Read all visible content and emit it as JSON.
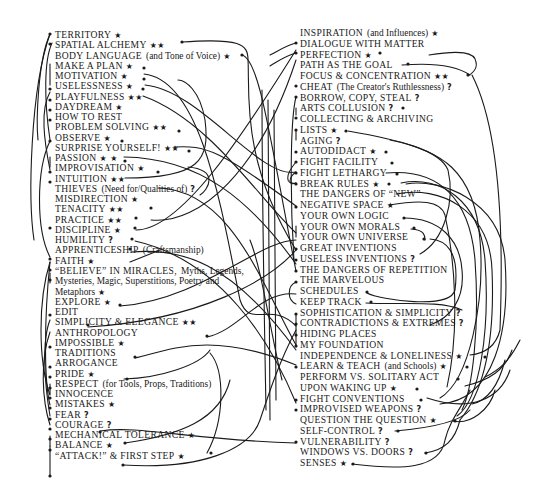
{
  "marks": {
    "star": "★",
    "two_stars": "★★",
    "question": "?"
  },
  "left": [
    {
      "text": "TERRITORY",
      "sub": "",
      "mark": "★"
    },
    {
      "text": "SPATIAL ALCHEMY",
      "sub": "",
      "mark": "★★"
    },
    {
      "text": "BODY LANGUAGE",
      "sub": "(and Tone of Voice)",
      "mark": "★"
    },
    {
      "text": "MAKE A PLAN",
      "sub": "",
      "mark": "★"
    },
    {
      "text": "MOTIVATION",
      "sub": "",
      "mark": "★"
    },
    {
      "text": "USELESSNESS",
      "sub": "",
      "mark": "★"
    },
    {
      "text": "PLAYFULNESS",
      "sub": "",
      "mark": "★★"
    },
    {
      "text": "DAYDREAM",
      "sub": "",
      "mark": "★"
    },
    {
      "text": "HOW TO REST",
      "sub": "",
      "mark": ""
    },
    {
      "text": "PROBLEM SOLVING",
      "sub": "",
      "mark": "★★"
    },
    {
      "text": "OBSERVE",
      "sub": "",
      "mark": "★"
    },
    {
      "text": "SURPRISE YOURSELF!",
      "sub": "",
      "mark": "★★"
    },
    {
      "text": "PASSION",
      "sub": "",
      "mark": "★ ★"
    },
    {
      "text": "IMPROVISATION",
      "sub": "",
      "mark": "★"
    },
    {
      "text": "INTUITION",
      "sub": "",
      "mark": "★★"
    },
    {
      "text": "THIEVES",
      "sub": "(Need for/Qualities of)",
      "mark": "?"
    },
    {
      "text": "MISDIRECTION",
      "sub": "",
      "mark": "★"
    },
    {
      "text": "TENACITY",
      "sub": "",
      "mark": "★★"
    },
    {
      "text": "PRACTICE",
      "sub": "",
      "mark": "★★"
    },
    {
      "text": "DISCIPLINE",
      "sub": "",
      "mark": "★"
    },
    {
      "text": "HUMILITY",
      "sub": "",
      "mark": "?"
    },
    {
      "text": "APPRENTICESHIP",
      "sub": "(Craftsmanship)",
      "mark": ""
    },
    {
      "text": "FAITH",
      "sub": "",
      "mark": "★"
    },
    {
      "text": "“BELIEVE” IN MIRACLES,",
      "sub": "Myths, Legends,",
      "mark": ""
    },
    {
      "text": "",
      "sub": "Mysteries, Magic, Superstitions, Poetry and",
      "mark": ""
    },
    {
      "text": "",
      "sub": "Metaphors",
      "mark": "★"
    },
    {
      "text": "EXPLORE",
      "sub": "",
      "mark": "★"
    },
    {
      "text": "EDIT",
      "sub": "",
      "mark": ""
    },
    {
      "text": "SIMPLICITY & ELEGANCE",
      "sub": "",
      "mark": "★★"
    },
    {
      "text": "ANTHROPOLOGY",
      "sub": "",
      "mark": ""
    },
    {
      "text": "IMPOSSIBLE",
      "sub": "",
      "mark": "★"
    },
    {
      "text": "TRADITIONS",
      "sub": "",
      "mark": ""
    },
    {
      "text": "ARROGANCE",
      "sub": "",
      "mark": ""
    },
    {
      "text": "PRIDE",
      "sub": "",
      "mark": "★"
    },
    {
      "text": "RESPECT",
      "sub": "(for Tools, Props, Traditions)",
      "mark": ""
    },
    {
      "text": "INNOCENCE",
      "sub": "",
      "mark": ""
    },
    {
      "text": "MISTAKES",
      "sub": "",
      "mark": "★"
    },
    {
      "text": "FEAR",
      "sub": "",
      "mark": "?"
    },
    {
      "text": "COURAGE",
      "sub": "",
      "mark": "?"
    },
    {
      "text": "MECHANICAL TOLERANCE",
      "sub": "",
      "mark": "★"
    },
    {
      "text": "BALANCE",
      "sub": "",
      "mark": "★"
    },
    {
      "text": "“ATTACK!” & FIRST STEP",
      "sub": "",
      "mark": "★"
    }
  ],
  "right": [
    {
      "text": "INSPIRATION",
      "sub": "(and Influences)",
      "mark": "★"
    },
    {
      "text": "DIALOGUE WITH MATTER",
      "sub": "",
      "mark": ""
    },
    {
      "text": "PERFECTION",
      "sub": "",
      "mark": "★"
    },
    {
      "text": "PATH AS THE GOAL",
      "sub": "",
      "mark": ""
    },
    {
      "text": "FOCUS & CONCENTRATION",
      "sub": "",
      "mark": "★★"
    },
    {
      "text": "CHEAT",
      "sub": "(The Creator's Ruthlessness)",
      "mark": "?"
    },
    {
      "text": "BORROW, COPY, STEAL",
      "sub": "",
      "mark": "?"
    },
    {
      "text": "ARTS COLLUSION",
      "sub": "",
      "mark": "?"
    },
    {
      "text": "COLLECTING & ARCHIVING",
      "sub": "",
      "mark": ""
    },
    {
      "text": "LISTS",
      "sub": "",
      "mark": "★"
    },
    {
      "text": "AGING",
      "sub": "",
      "mark": "?"
    },
    {
      "text": "AUTODIDACT",
      "sub": "",
      "mark": "★"
    },
    {
      "text": "FIGHT FACILITY",
      "sub": "",
      "mark": ""
    },
    {
      "text": "FIGHT LETHARGY",
      "sub": "",
      "mark": ""
    },
    {
      "text": "BREAK RULES",
      "sub": "",
      "mark": "★"
    },
    {
      "text": "THE DANGERS OF “NEW”",
      "sub": "",
      "mark": ""
    },
    {
      "text": "NEGATIVE SPACE",
      "sub": "",
      "mark": "★"
    },
    {
      "text": "YOUR OWN LOGIC",
      "sub": "",
      "mark": ""
    },
    {
      "text": "YOUR OWN MORALS",
      "sub": "",
      "mark": ""
    },
    {
      "text": "YOUR OWN UNIVERSE",
      "sub": "",
      "mark": ""
    },
    {
      "text": "GREAT INVENTIONS",
      "sub": "",
      "mark": ""
    },
    {
      "text": "USELESS INVENTIONS",
      "sub": "",
      "mark": "?"
    },
    {
      "text": "THE DANGERS OF REPETITION",
      "sub": "",
      "mark": ""
    },
    {
      "text": "THE MARVELOUS",
      "sub": "",
      "mark": ""
    },
    {
      "text": "SCHEDULES",
      "sub": "",
      "mark": ""
    },
    {
      "text": "KEEP TRACK",
      "sub": "",
      "mark": ""
    },
    {
      "text": "SOPHISTICATION & SIMPLICITY",
      "sub": "",
      "mark": "?"
    },
    {
      "text": "CONTRADICTIONS & EXTREMES",
      "sub": "",
      "mark": "?"
    },
    {
      "text": "HIDING PLACES",
      "sub": "",
      "mark": ""
    },
    {
      "text": "MY FOUNDATION",
      "sub": "",
      "mark": ""
    },
    {
      "text": "INDEPENDENCE & LONELINESS",
      "sub": "",
      "mark": "★"
    },
    {
      "text": "LEARN & TEACH",
      "sub": "(and Schools)",
      "mark": "★"
    },
    {
      "text": "PERFORM VS. SOLITARY ACT",
      "sub": "",
      "mark": ""
    },
    {
      "text": "UPON WAKING UP",
      "sub": "",
      "mark": "★"
    },
    {
      "text": "FIGHT CONVENTIONS",
      "sub": "",
      "mark": ""
    },
    {
      "text": "IMPROVISED WEAPONS",
      "sub": "",
      "mark": "?"
    },
    {
      "text": "QUESTION THE QUESTION",
      "sub": "",
      "mark": "★"
    },
    {
      "text": "SELF-CONTROL",
      "sub": "",
      "mark": "?"
    },
    {
      "text": "VULNERABILITY",
      "sub": "",
      "mark": "?"
    },
    {
      "text": "WINDOWS VS. DOORS",
      "sub": "",
      "mark": "?"
    },
    {
      "text": "SENSES",
      "sub": "",
      "mark": "★"
    }
  ]
}
